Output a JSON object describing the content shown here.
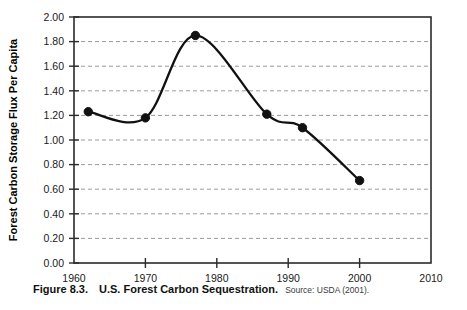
{
  "figure": {
    "label": "Figure 8.3.",
    "title": "U.S. Forest Carbon Sequestration.",
    "source": "Source: USDA (2001)."
  },
  "chart_data": {
    "type": "line",
    "title": "U.S. Forest Carbon Sequestration.",
    "xlabel": "",
    "ylabel": "Forest Carbon Storage Flux Per Capita",
    "xlim": [
      1960,
      2010
    ],
    "ylim": [
      0.0,
      2.0
    ],
    "grid": true,
    "legend": "none",
    "x_ticks": [
      1960,
      1970,
      1980,
      1990,
      2000,
      2010
    ],
    "x_tick_labels": [
      "1960",
      "1970",
      "1980",
      "1990",
      "2000",
      "2010"
    ],
    "y_ticks": [
      0.0,
      0.2,
      0.4,
      0.6,
      0.8,
      1.0,
      1.2,
      1.4,
      1.6,
      1.8,
      2.0
    ],
    "y_tick_labels": [
      "0.00",
      "0.20",
      "0.40",
      "0.60",
      "0.80",
      "1.00",
      "1.20",
      "1.40",
      "1.60",
      "1.80",
      "2.00"
    ],
    "x": [
      1962,
      1970,
      1977,
      1987,
      1992,
      2000
    ],
    "values": [
      1.23,
      1.18,
      1.85,
      1.21,
      1.1,
      0.67
    ],
    "series": [
      {
        "name": "Forest carbon storage flux per capita",
        "color": "#111111",
        "points": [
          {
            "x": 1962,
            "y": 1.23
          },
          {
            "x": 1970,
            "y": 1.18
          },
          {
            "x": 1977,
            "y": 1.85
          },
          {
            "x": 1987,
            "y": 1.21
          },
          {
            "x": 1992,
            "y": 1.1
          },
          {
            "x": 2000,
            "y": 0.67
          }
        ]
      }
    ]
  },
  "colors": {
    "line": "#111111",
    "grid": "#9a9a9a",
    "frame": "#2b2b2b",
    "text": "#1a1a1a"
  }
}
